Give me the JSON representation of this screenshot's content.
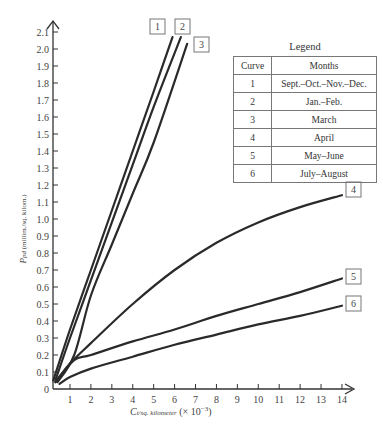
{
  "chart_data": {
    "type": "line",
    "title": "",
    "xlabel": "C_t/sq. kilometer (× 10^-3)",
    "ylabel": "P_pd (millim./sq. kilom.)",
    "xlim": [
      0,
      14.5
    ],
    "ylim": [
      0,
      2.15
    ],
    "x_ticks": [
      "1",
      "2",
      "3",
      "4",
      "5",
      "6",
      "7",
      "8",
      "9",
      "10",
      "11",
      "12",
      "13",
      "14"
    ],
    "y_ticks": [
      "0",
      "0.1",
      "0.2",
      "0.3",
      "0.4",
      "0.5",
      "0.6",
      "0.7",
      "0.8",
      "0.9",
      "1.0",
      "1.1",
      "1.2",
      "1.3",
      "1.4",
      "1.5",
      "1.6",
      "1.7",
      "1.8",
      "1.9",
      "2.0",
      "2.1"
    ],
    "grid": false,
    "legend_position": "upper right (table)",
    "series": [
      {
        "name": "1",
        "label": "Sept.–Oct.–Nov.–Dec.",
        "x": [
          0.2,
          1,
          2,
          3,
          4,
          5,
          5.9
        ],
        "y": [
          0.05,
          0.35,
          0.7,
          1.05,
          1.4,
          1.75,
          2.07
        ]
      },
      {
        "name": "2",
        "label": "Jan.–Feb.",
        "x": [
          0.3,
          1,
          2,
          3,
          4,
          5,
          6.3
        ],
        "y": [
          0.05,
          0.3,
          0.64,
          0.98,
          1.32,
          1.66,
          2.07
        ]
      },
      {
        "name": "3",
        "label": "March",
        "x": [
          0.4,
          1.2,
          2,
          3,
          4,
          5,
          6.6
        ],
        "y": [
          0.04,
          0.2,
          0.55,
          0.85,
          1.15,
          1.45,
          2.03
        ]
      },
      {
        "name": "4",
        "label": "April",
        "x": [
          0.3,
          1,
          2,
          4,
          6,
          8,
          10,
          12,
          14
        ],
        "y": [
          0.04,
          0.15,
          0.27,
          0.5,
          0.7,
          0.86,
          0.98,
          1.07,
          1.14
        ]
      },
      {
        "name": "5",
        "label": "May–June",
        "x": [
          0.3,
          1.2,
          2,
          4,
          6,
          8,
          10,
          12,
          14
        ],
        "y": [
          0.04,
          0.17,
          0.2,
          0.28,
          0.35,
          0.43,
          0.5,
          0.57,
          0.65
        ]
      },
      {
        "name": "6",
        "label": "July–August",
        "x": [
          0.5,
          1,
          2,
          4,
          6,
          8,
          10,
          12,
          14
        ],
        "y": [
          0.03,
          0.07,
          0.12,
          0.19,
          0.26,
          0.32,
          0.38,
          0.43,
          0.49
        ]
      }
    ]
  },
  "legend": {
    "title": "Legend",
    "headers": [
      "Curve",
      "Months"
    ],
    "rows": [
      {
        "curve": "1",
        "months": "Sept.–Oct.–Nov.–Dec."
      },
      {
        "curve": "2",
        "months": "Jan.–Feb."
      },
      {
        "curve": "3",
        "months": "March"
      },
      {
        "curve": "4",
        "months": "April"
      },
      {
        "curve": "5",
        "months": "May–June"
      },
      {
        "curve": "6",
        "months": "July–August"
      }
    ]
  },
  "axes": {
    "y_label_main": "P",
    "y_label_sub": "pd",
    "y_label_units": " (millim./sq. kilom.)",
    "x_label_main": "C",
    "x_label_sub": "t/sq. kilometer",
    "x_label_units": " (× 10",
    "x_label_exp": "−3",
    "x_label_close": ")"
  },
  "colors": {
    "line": "#2a2a2a",
    "axis": "#333333",
    "box": "#777777"
  }
}
